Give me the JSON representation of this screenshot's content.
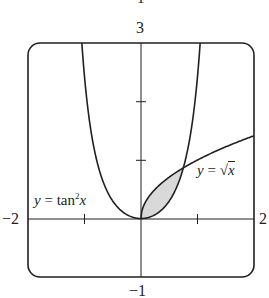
{
  "chart_data": {
    "type": "line",
    "title": "",
    "xlabel": "",
    "ylabel": "",
    "xlim": [
      -2,
      2
    ],
    "ylim": [
      -1,
      3
    ],
    "grid": false,
    "ticks": {
      "x": [
        -1,
        1
      ],
      "y": [
        1,
        2
      ]
    },
    "window_labels": {
      "top": "3",
      "bottom": "-1",
      "left": "-2",
      "right": "2"
    },
    "cropped_top_text": "1",
    "series": [
      {
        "name": "y = tan²x",
        "function": "tan(x)^2",
        "domain": [
          -1.047,
          1.047
        ],
        "points": [
          [
            -1.047,
            3
          ],
          [
            -0.9,
            1.59
          ],
          [
            -0.75,
            0.868
          ],
          [
            -0.5,
            0.298
          ],
          [
            -0.25,
            0.065
          ],
          [
            0,
            0
          ],
          [
            0.25,
            0.065
          ],
          [
            0.5,
            0.298
          ],
          [
            0.75,
            0.868
          ],
          [
            0.9,
            1.59
          ],
          [
            1.047,
            3
          ]
        ]
      },
      {
        "name": "y = √x",
        "function": "sqrt(x)",
        "domain": [
          0,
          2
        ],
        "points": [
          [
            0,
            0
          ],
          [
            0.25,
            0.5
          ],
          [
            0.5,
            0.707
          ],
          [
            0.75,
            0.866
          ],
          [
            1,
            1
          ],
          [
            1.5,
            1.225
          ],
          [
            2,
            1.414
          ]
        ]
      }
    ],
    "shaded_region": {
      "between": [
        "sqrt(x)",
        "tan(x)^2"
      ],
      "x_range": [
        0,
        0.75
      ],
      "fill": "#d9d9d9"
    },
    "annotations": [
      {
        "text": "y = tan²x",
        "near": [
          -1.6,
          0.35
        ]
      },
      {
        "text": "y = √x",
        "near": [
          1.45,
          0.9
        ]
      }
    ]
  },
  "labels": {
    "top": "3",
    "bottom": "−1",
    "left": "−2",
    "right": "2",
    "cropped": "1",
    "tan_label_y": "y",
    "tan_label_eq": " = tan",
    "tan_label_exp": "2",
    "tan_label_x": "x",
    "sqrt_label_y": "y",
    "sqrt_label_eq": " = ",
    "sqrt_label_x": "x"
  },
  "colors": {
    "line": "#231f20",
    "shade": "#d9d9d9",
    "background": "#ffffff"
  }
}
